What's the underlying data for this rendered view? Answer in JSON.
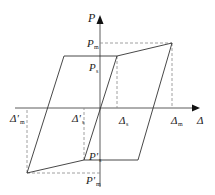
{
  "diagram": {
    "axes": {
      "y_label": "P",
      "x_label": "Δ"
    },
    "labels": {
      "Pm": {
        "main": "P",
        "sub": "m"
      },
      "Ps": {
        "main": "P",
        "sub": "s"
      },
      "Ps_neg": {
        "main": "P'",
        "sub": "s"
      },
      "Pm_neg": {
        "main": "P'",
        "sub": "m"
      },
      "Dm_neg": {
        "main": "Δ'",
        "sub": "m"
      },
      "Ds_neg": {
        "main": "Δ'",
        "sub": "s"
      },
      "Ds": {
        "main": "Δ",
        "sub": "s"
      },
      "Dm": {
        "main": "Δ",
        "sub": "m"
      }
    },
    "colors": {
      "line": "#333333",
      "dashed": "#888888",
      "background": "#ffffff"
    }
  }
}
